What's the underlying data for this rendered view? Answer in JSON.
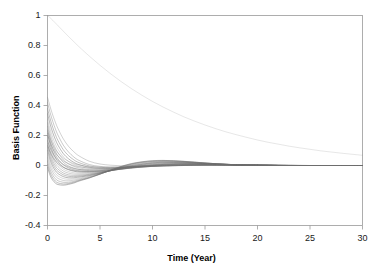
{
  "chart_data": {
    "type": "line",
    "title": "",
    "xlabel": "Time (Year)",
    "ylabel": "Basis Function",
    "xlim": [
      0,
      30
    ],
    "ylim": [
      -0.4,
      1.0
    ],
    "xticks": [
      "0",
      "5",
      "10",
      "15",
      "20",
      "25",
      "30"
    ],
    "xtick_values": [
      0,
      5,
      10,
      15,
      20,
      25,
      30
    ],
    "yticks": [
      "1",
      "0.8",
      "0.6",
      "0.4",
      "0.2",
      "0",
      "-0.2",
      "-0.4"
    ],
    "ytick_values": [
      1,
      0.8,
      0.6,
      0.4,
      0.2,
      0,
      -0.2,
      -0.4
    ],
    "grid": false,
    "legend": "none",
    "line_color": "#6e6e6e",
    "axis_color": "#9a9a9a",
    "text_color": "#1a1a1a",
    "background": "#ffffff",
    "series_note": "Ensemble of decaying basis functions; each starts at a distinct value at t=0 and relaxes toward 0 with damped oscillation.",
    "x": [
      0,
      0.25,
      0.5,
      0.75,
      1,
      1.5,
      2,
      2.5,
      3,
      4,
      5,
      6,
      7,
      8,
      9,
      10,
      11,
      12,
      13,
      14,
      15,
      16,
      17,
      18,
      19,
      20,
      21,
      22,
      23,
      24,
      25,
      26,
      27,
      28,
      29,
      30
    ],
    "series": [
      {
        "name": "b1",
        "values": [
          1.0,
          0.985,
          0.968,
          0.95,
          0.932,
          0.896,
          0.86,
          0.826,
          0.792,
          0.728,
          0.668,
          0.612,
          0.56,
          0.512,
          0.468,
          0.427,
          0.39,
          0.356,
          0.324,
          0.296,
          0.27,
          0.246,
          0.224,
          0.205,
          0.187,
          0.17,
          0.155,
          0.142,
          0.129,
          0.118,
          0.108,
          0.098,
          0.09,
          0.082,
          0.075,
          0.068
        ]
      },
      {
        "name": "b2",
        "values": [
          0.455,
          0.392,
          0.336,
          0.288,
          0.246,
          0.178,
          0.128,
          0.092,
          0.064,
          0.028,
          0.01,
          0.002,
          -0.002,
          -0.004,
          -0.004,
          -0.003,
          -0.002,
          -0.001,
          0.0,
          0.0,
          0.001,
          0.001,
          0.001,
          0.001,
          0.001,
          0.001,
          0.0,
          0.0,
          0.0,
          0.0,
          0.0,
          0.0,
          0.0,
          0.0,
          0.0,
          0.0
        ]
      },
      {
        "name": "b3",
        "values": [
          0.42,
          0.352,
          0.294,
          0.244,
          0.202,
          0.136,
          0.09,
          0.057,
          0.034,
          0.006,
          -0.006,
          -0.01,
          -0.01,
          -0.008,
          -0.006,
          -0.004,
          -0.002,
          -0.001,
          0.0,
          0.001,
          0.001,
          0.002,
          0.002,
          0.002,
          0.001,
          0.001,
          0.001,
          0.001,
          0.0,
          0.0,
          0.0,
          0.0,
          0.0,
          0.0,
          0.0,
          0.0
        ]
      },
      {
        "name": "b4",
        "values": [
          0.38,
          0.312,
          0.254,
          0.206,
          0.166,
          0.106,
          0.066,
          0.038,
          0.019,
          -0.003,
          -0.012,
          -0.015,
          -0.014,
          -0.011,
          -0.008,
          -0.005,
          -0.003,
          -0.001,
          0.0,
          0.001,
          0.002,
          0.002,
          0.002,
          0.002,
          0.002,
          0.001,
          0.001,
          0.001,
          0.0,
          0.0,
          0.0,
          0.0,
          0.0,
          0.0,
          0.0,
          0.0
        ]
      },
      {
        "name": "b5",
        "values": [
          0.345,
          0.276,
          0.219,
          0.173,
          0.135,
          0.08,
          0.045,
          0.021,
          0.006,
          -0.012,
          -0.019,
          -0.02,
          -0.018,
          -0.014,
          -0.01,
          -0.006,
          -0.003,
          -0.001,
          0.001,
          0.002,
          0.003,
          0.003,
          0.003,
          0.002,
          0.002,
          0.002,
          0.001,
          0.001,
          0.001,
          0.0,
          0.0,
          0.0,
          0.0,
          0.0,
          0.0,
          0.0
        ]
      },
      {
        "name": "b6",
        "values": [
          0.31,
          0.242,
          0.187,
          0.143,
          0.108,
          0.058,
          0.027,
          0.007,
          -0.005,
          -0.019,
          -0.024,
          -0.024,
          -0.021,
          -0.016,
          -0.011,
          -0.006,
          -0.002,
          0.0,
          0.002,
          0.003,
          0.004,
          0.004,
          0.004,
          0.003,
          0.003,
          0.002,
          0.002,
          0.001,
          0.001,
          0.001,
          0.0,
          0.0,
          0.0,
          0.0,
          0.0,
          0.0
        ]
      },
      {
        "name": "b7",
        "values": [
          0.285,
          0.214,
          0.159,
          0.117,
          0.084,
          0.038,
          0.011,
          -0.006,
          -0.016,
          -0.027,
          -0.03,
          -0.028,
          -0.023,
          -0.017,
          -0.011,
          -0.005,
          -0.001,
          0.002,
          0.004,
          0.005,
          0.005,
          0.005,
          0.004,
          0.004,
          0.003,
          0.002,
          0.002,
          0.001,
          0.001,
          0.001,
          0.0,
          0.0,
          0.0,
          0.0,
          0.0,
          0.0
        ]
      },
      {
        "name": "b8",
        "values": [
          0.262,
          0.19,
          0.135,
          0.094,
          0.063,
          0.021,
          -0.003,
          -0.017,
          -0.026,
          -0.034,
          -0.035,
          -0.031,
          -0.025,
          -0.017,
          -0.01,
          -0.004,
          0.001,
          0.004,
          0.006,
          0.007,
          0.007,
          0.006,
          0.005,
          0.004,
          0.003,
          0.002,
          0.002,
          0.001,
          0.001,
          0.0,
          0.0,
          0.0,
          0.0,
          0.0,
          0.0,
          0.0
        ]
      },
      {
        "name": "b9",
        "values": [
          0.238,
          0.166,
          0.112,
          0.072,
          0.043,
          0.005,
          -0.016,
          -0.028,
          -0.035,
          -0.04,
          -0.039,
          -0.033,
          -0.025,
          -0.016,
          -0.008,
          -0.001,
          0.004,
          0.007,
          0.009,
          0.009,
          0.008,
          0.007,
          0.006,
          0.004,
          0.003,
          0.002,
          0.002,
          0.001,
          0.001,
          0.0,
          0.0,
          0.0,
          0.0,
          0.0,
          0.0,
          0.0
        ]
      },
      {
        "name": "b10",
        "values": [
          0.215,
          0.144,
          0.09,
          0.052,
          0.025,
          -0.01,
          -0.028,
          -0.038,
          -0.043,
          -0.045,
          -0.042,
          -0.034,
          -0.024,
          -0.014,
          -0.005,
          0.002,
          0.007,
          0.01,
          0.011,
          0.011,
          0.01,
          0.008,
          0.006,
          0.005,
          0.003,
          0.002,
          0.001,
          0.001,
          0.0,
          0.0,
          0.0,
          0.0,
          0.0,
          0.0,
          0.0,
          0.0
        ]
      },
      {
        "name": "b11",
        "values": [
          0.192,
          0.122,
          0.07,
          0.033,
          0.008,
          -0.024,
          -0.04,
          -0.048,
          -0.051,
          -0.05,
          -0.045,
          -0.035,
          -0.023,
          -0.012,
          -0.002,
          0.005,
          0.01,
          0.012,
          0.013,
          0.012,
          0.011,
          0.009,
          0.007,
          0.005,
          0.003,
          0.002,
          0.001,
          0.001,
          0.0,
          0.0,
          0.0,
          0.0,
          0.0,
          0.0,
          0.0,
          0.0
        ]
      },
      {
        "name": "b12",
        "values": [
          0.17,
          0.101,
          0.05,
          0.015,
          -0.008,
          -0.037,
          -0.051,
          -0.057,
          -0.058,
          -0.055,
          -0.047,
          -0.035,
          -0.022,
          -0.009,
          0.001,
          0.008,
          0.013,
          0.015,
          0.015,
          0.014,
          0.012,
          0.009,
          0.007,
          0.005,
          0.003,
          0.002,
          0.001,
          0.0,
          0.0,
          0.0,
          0.0,
          0.0,
          0.0,
          0.0,
          0.0,
          0.0
        ]
      },
      {
        "name": "b13",
        "values": [
          0.148,
          0.08,
          0.031,
          -0.002,
          -0.024,
          -0.05,
          -0.062,
          -0.066,
          -0.065,
          -0.059,
          -0.049,
          -0.035,
          -0.02,
          -0.007,
          0.004,
          0.012,
          0.016,
          0.018,
          0.017,
          0.015,
          0.013,
          0.01,
          0.007,
          0.005,
          0.003,
          0.002,
          0.001,
          0.0,
          0.0,
          0.0,
          0.0,
          0.0,
          0.0,
          0.0,
          0.0,
          0.0
        ]
      },
      {
        "name": "b14",
        "values": [
          0.125,
          0.059,
          0.012,
          -0.019,
          -0.039,
          -0.062,
          -0.072,
          -0.074,
          -0.071,
          -0.063,
          -0.05,
          -0.034,
          -0.018,
          -0.004,
          0.007,
          0.015,
          0.019,
          0.02,
          0.019,
          0.017,
          0.013,
          0.01,
          0.007,
          0.005,
          0.003,
          0.002,
          0.001,
          0.0,
          0.0,
          0.0,
          0.0,
          0.0,
          0.0,
          0.0,
          0.0,
          0.0
        ]
      },
      {
        "name": "b15",
        "values": [
          0.102,
          0.038,
          -0.006,
          -0.035,
          -0.054,
          -0.074,
          -0.082,
          -0.082,
          -0.077,
          -0.067,
          -0.052,
          -0.034,
          -0.016,
          -0.001,
          0.01,
          0.018,
          0.022,
          0.022,
          0.021,
          0.018,
          0.014,
          0.011,
          0.008,
          0.005,
          0.003,
          0.002,
          0.001,
          0.0,
          0.0,
          0.0,
          0.0,
          0.0,
          0.0,
          0.0,
          0.0,
          0.0
        ]
      },
      {
        "name": "b16",
        "values": [
          0.078,
          0.016,
          -0.026,
          -0.053,
          -0.07,
          -0.087,
          -0.092,
          -0.09,
          -0.084,
          -0.071,
          -0.054,
          -0.034,
          -0.014,
          0.002,
          0.013,
          0.021,
          0.025,
          0.025,
          0.023,
          0.019,
          0.015,
          0.011,
          0.008,
          0.005,
          0.003,
          0.002,
          0.001,
          0.0,
          0.0,
          0.0,
          0.0,
          0.0,
          0.0,
          0.0,
          0.0,
          0.0
        ]
      },
      {
        "name": "b17",
        "values": [
          0.055,
          -0.005,
          -0.045,
          -0.07,
          -0.086,
          -0.1,
          -0.102,
          -0.098,
          -0.09,
          -0.075,
          -0.056,
          -0.034,
          -0.012,
          0.005,
          0.017,
          0.024,
          0.027,
          0.027,
          0.024,
          0.02,
          0.016,
          0.012,
          0.008,
          0.005,
          0.003,
          0.002,
          0.001,
          0.0,
          0.0,
          0.0,
          0.0,
          0.0,
          0.0,
          0.0,
          0.0,
          0.0
        ]
      },
      {
        "name": "b18",
        "values": [
          0.03,
          -0.028,
          -0.065,
          -0.088,
          -0.102,
          -0.112,
          -0.112,
          -0.106,
          -0.096,
          -0.079,
          -0.057,
          -0.033,
          -0.01,
          0.008,
          0.02,
          0.027,
          0.03,
          0.029,
          0.026,
          0.021,
          0.016,
          0.012,
          0.008,
          0.005,
          0.003,
          0.002,
          0.001,
          0.0,
          0.0,
          0.0,
          0.0,
          0.0,
          0.0,
          0.0,
          0.0,
          0.0
        ]
      },
      {
        "name": "b19",
        "values": [
          0.008,
          -0.048,
          -0.083,
          -0.104,
          -0.116,
          -0.123,
          -0.12,
          -0.112,
          -0.1,
          -0.081,
          -0.057,
          -0.032,
          -0.008,
          0.011,
          0.023,
          0.03,
          0.032,
          0.031,
          0.027,
          0.022,
          0.017,
          0.012,
          0.008,
          0.005,
          0.003,
          0.002,
          0.001,
          0.0,
          0.0,
          0.0,
          0.0,
          0.0,
          0.0,
          0.0,
          0.0,
          0.0
        ]
      },
      {
        "name": "b20",
        "values": [
          -0.012,
          -0.066,
          -0.098,
          -0.117,
          -0.127,
          -0.131,
          -0.126,
          -0.117,
          -0.104,
          -0.083,
          -0.058,
          -0.031,
          -0.006,
          0.013,
          0.025,
          0.032,
          0.034,
          0.032,
          0.028,
          0.023,
          0.017,
          0.012,
          0.008,
          0.005,
          0.003,
          0.002,
          0.001,
          0.0,
          0.0,
          0.0,
          0.0,
          0.0,
          0.0,
          0.0,
          0.0,
          0.0
        ]
      },
      {
        "name": "b21",
        "values": [
          0.23,
          0.18,
          0.14,
          0.108,
          0.084,
          0.05,
          0.028,
          0.013,
          0.003,
          -0.008,
          -0.012,
          -0.012,
          -0.01,
          -0.007,
          -0.004,
          -0.001,
          0.001,
          0.003,
          0.004,
          0.004,
          0.004,
          0.003,
          0.003,
          0.002,
          0.002,
          0.001,
          0.001,
          0.001,
          0.0,
          0.0,
          0.0,
          0.0,
          0.0,
          0.0,
          0.0,
          0.0
        ]
      },
      {
        "name": "b22",
        "values": [
          0.2,
          0.152,
          0.114,
          0.085,
          0.062,
          0.031,
          0.012,
          -0.001,
          -0.009,
          -0.017,
          -0.019,
          -0.017,
          -0.013,
          -0.009,
          -0.004,
          -0.001,
          0.002,
          0.004,
          0.005,
          0.005,
          0.005,
          0.004,
          0.003,
          0.003,
          0.002,
          0.001,
          0.001,
          0.001,
          0.0,
          0.0,
          0.0,
          0.0,
          0.0,
          0.0,
          0.0,
          0.0
        ]
      },
      {
        "name": "b23",
        "values": [
          0.165,
          0.118,
          0.082,
          0.055,
          0.034,
          0.007,
          -0.009,
          -0.02,
          -0.026,
          -0.03,
          -0.029,
          -0.024,
          -0.017,
          -0.01,
          -0.004,
          0.001,
          0.005,
          0.007,
          0.008,
          0.008,
          0.007,
          0.006,
          0.004,
          0.003,
          0.002,
          0.001,
          0.001,
          0.0,
          0.0,
          0.0,
          0.0,
          0.0,
          0.0,
          0.0,
          0.0,
          0.0
        ]
      },
      {
        "name": "b24",
        "values": [
          0.135,
          0.09,
          0.056,
          0.031,
          0.012,
          -0.012,
          -0.026,
          -0.034,
          -0.038,
          -0.039,
          -0.035,
          -0.027,
          -0.018,
          -0.009,
          -0.001,
          0.005,
          0.009,
          0.011,
          0.011,
          0.011,
          0.009,
          0.007,
          0.005,
          0.004,
          0.002,
          0.002,
          0.001,
          0.0,
          0.0,
          0.0,
          0.0,
          0.0,
          0.0,
          0.0,
          0.0,
          0.0
        ]
      }
    ]
  },
  "axis": {
    "x_title": "Time (Year)",
    "y_title": "Basis Function"
  }
}
